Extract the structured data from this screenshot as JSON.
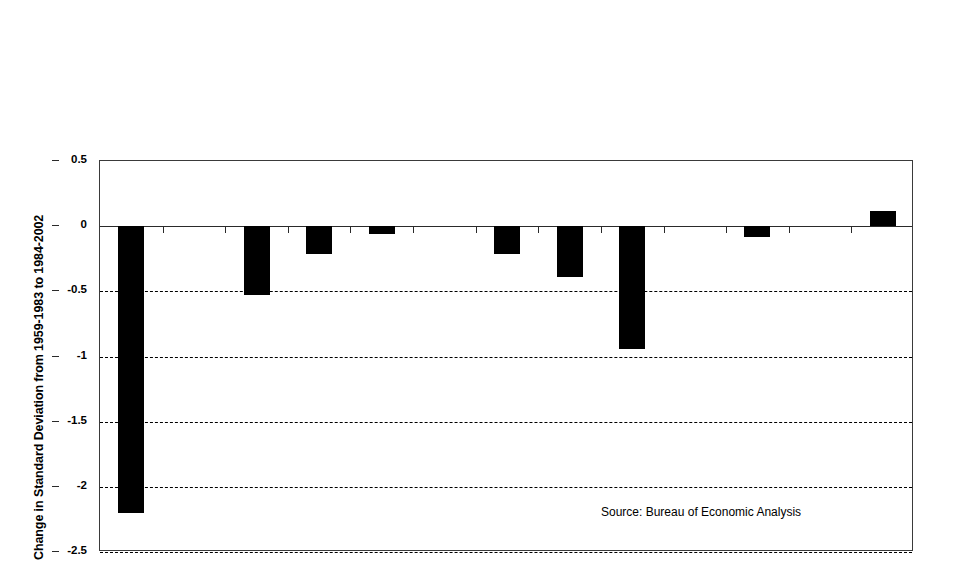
{
  "chart_data": {
    "type": "bar",
    "title": "",
    "xlabel": "",
    "ylabel": "Change in Standard Deviation from 1959-1983 to 1984-2002",
    "ylim": [
      -2.5,
      0.5
    ],
    "yticks": [
      0.5,
      0,
      -0.5,
      -1,
      -1.5,
      -2,
      -2.5
    ],
    "ytick_labels": [
      "0.5",
      "0",
      "-0.5",
      "-1",
      "-1.5",
      "-2",
      "-2.5"
    ],
    "grid": "horizontal-dashed",
    "legend": "none",
    "categories": [
      "Total",
      "Durables",
      "Nondurables",
      "Services",
      "Nonresidential Fixed",
      "Residential",
      "Inventory",
      "Government",
      "Net Exports"
    ],
    "values": [
      -2.2,
      -0.53,
      -0.21,
      -0.06,
      -0.21,
      -0.39,
      -0.94,
      -0.08,
      0.12
    ],
    "bar_color": "#000000",
    "annotations": [
      "Source: Bureau of Economic Analysis"
    ]
  },
  "axes": {
    "y_title": "Change in Standard Deviation from 1959-1983 to 1984-2002",
    "tick_labels": [
      "0.5",
      "0",
      "-0.5",
      "-1",
      "-1.5",
      "-2",
      "-2.5"
    ]
  },
  "category_labels": [
    "Total",
    "Durables",
    "Nondurables",
    "Services",
    "Nonresidential Fixed",
    "Residential",
    "Inventory",
    "Government",
    "Net Exports"
  ],
  "source_note": "Source: Bureau of Economic Analysis",
  "colors": {
    "bar": "#000000",
    "axis": "#2a2a2a",
    "grid": "#000000",
    "background": "#ffffff"
  }
}
